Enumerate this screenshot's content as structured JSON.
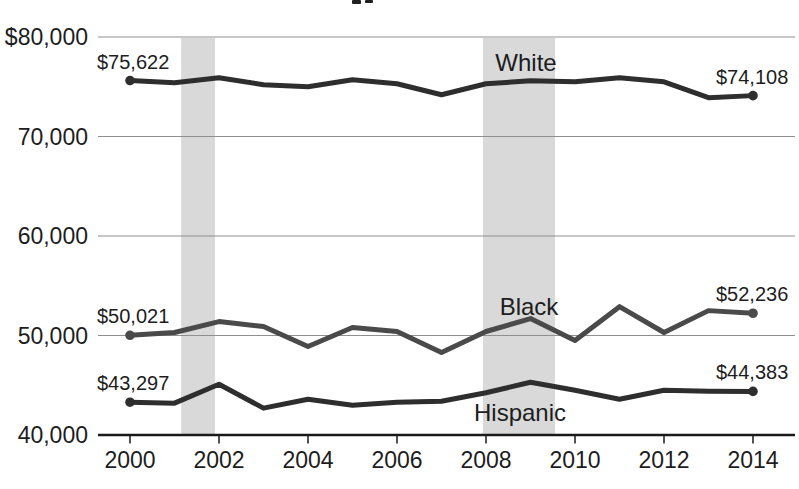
{
  "canvas": {
    "width": 799,
    "height": 489,
    "background": "#ffffff"
  },
  "chart_data": {
    "type": "line",
    "title": "",
    "note": "cropped title fragment visible at top edge",
    "x": [
      2000,
      2001,
      2002,
      2003,
      2004,
      2005,
      2006,
      2007,
      2008,
      2009,
      2010,
      2011,
      2012,
      2013,
      2014
    ],
    "xlabel": "",
    "ylabel": "",
    "ylim": [
      40000,
      80000
    ],
    "grid": "horizontal",
    "legend": "inline-series-labels",
    "yticks": [
      {
        "value": 80000,
        "label": "$80,000"
      },
      {
        "value": 70000,
        "label": "70,000"
      },
      {
        "value": 60000,
        "label": "60,000"
      },
      {
        "value": 50000,
        "label": "50,000"
      },
      {
        "value": 40000,
        "label": "40,000"
      }
    ],
    "xticks": [
      {
        "value": 2000,
        "label": "2000"
      },
      {
        "value": 2002,
        "label": "2002"
      },
      {
        "value": 2004,
        "label": "2004"
      },
      {
        "value": 2006,
        "label": "2006"
      },
      {
        "value": 2008,
        "label": "2008"
      },
      {
        "value": 2010,
        "label": "2010"
      },
      {
        "value": 2012,
        "label": "2012"
      },
      {
        "value": 2014,
        "label": "2014"
      }
    ],
    "series": [
      {
        "name": "White",
        "color": "#2e2e2e",
        "values": [
          75622,
          75400,
          75900,
          75200,
          75000,
          75700,
          75300,
          74200,
          75300,
          75600,
          75500,
          75900,
          75500,
          73900,
          74108
        ],
        "first_point_label": "$75,622",
        "last_point_label": "$74,108"
      },
      {
        "name": "Black",
        "color": "#4a4a4a",
        "values": [
          50021,
          50300,
          51400,
          50900,
          48900,
          50800,
          50400,
          48300,
          50400,
          51700,
          49500,
          52900,
          50300,
          52500,
          52236
        ],
        "first_point_label": "$50,021",
        "last_point_label": "$52,236"
      },
      {
        "name": "Hispanic",
        "color": "#2e2e2e",
        "values": [
          43297,
          43200,
          45100,
          42700,
          43600,
          43000,
          43300,
          43400,
          44250,
          45300,
          44500,
          43600,
          44500,
          44400,
          44383
        ],
        "first_point_label": "$43,297",
        "last_point_label": "$44,383"
      }
    ],
    "recession_bands": [
      {
        "from": 2001.15,
        "to": 2001.91
      },
      {
        "from": 2007.93,
        "to": 2009.55
      }
    ],
    "band_color": "#d9d9d9",
    "gridline_color": "#8f8f8f",
    "axis_color": "#1a1a1a"
  }
}
